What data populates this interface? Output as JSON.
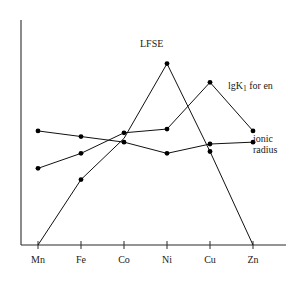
{
  "chart_data": {
    "type": "line",
    "title": "",
    "xlabel": "",
    "ylabel": "",
    "categories": [
      "Mn",
      "Fe",
      "Co",
      "Ni",
      "Cu",
      "Zn"
    ],
    "grid": false,
    "legend_position": "inline-annotations",
    "xlim": [
      0,
      7
    ],
    "ylim": [
      0,
      10
    ],
    "series": [
      {
        "name": "LFSE",
        "label_text": "LFSE",
        "values": [
          0.0,
          3.5,
          5.7,
          9.7,
          5.0,
          0.0
        ],
        "markers": [
          false,
          true,
          false,
          true,
          true,
          false
        ]
      },
      {
        "name": "lgK1 for en",
        "label_text": "lgK",
        "label_sub": "1",
        "label_tail": " for en",
        "values": [
          4.1,
          4.9,
          6.0,
          6.2,
          8.7,
          6.1
        ],
        "markers": [
          true,
          true,
          true,
          true,
          true,
          true
        ]
      },
      {
        "name": "ionic radius",
        "label_line1": "ionic",
        "label_line2": "radius",
        "values": [
          6.1,
          5.8,
          5.5,
          4.9,
          5.4,
          5.5
        ],
        "markers": [
          true,
          true,
          true,
          true,
          true,
          true
        ]
      }
    ],
    "annotations": [
      {
        "text": "LFSE",
        "near_category": "Ni"
      },
      {
        "text": "lgK1 for en",
        "near_category": "Cu"
      },
      {
        "text": "ionic radius",
        "near_category": "Zn"
      }
    ]
  }
}
